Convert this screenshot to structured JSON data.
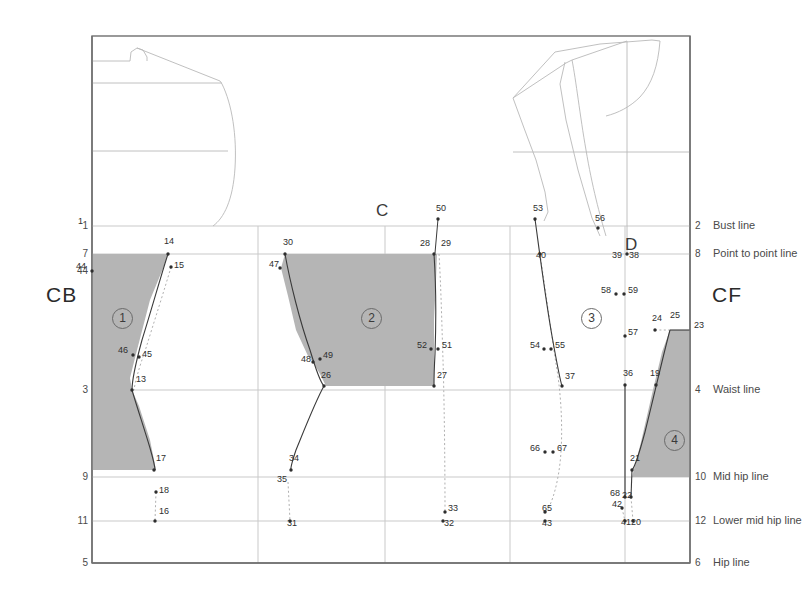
{
  "axis_labels": {
    "center_back": "CB",
    "center_front": "CF",
    "upper_center": "C",
    "bust_point_marker": "D"
  },
  "colors": {
    "piece_fill": "#b5b5b5",
    "piece_stroke": "#3a3a3a",
    "grid": "#c9c9c9",
    "frame": "#6f6f6f",
    "outline": "#b9b9b9",
    "dotted": "#b0b0b0",
    "text": "#3c3c3c"
  },
  "horizontal_lines": [
    {
      "left_num": "1",
      "right_num": "2",
      "right_label": "Bust line",
      "y": 226,
      "x1": 92,
      "x2": 690,
      "weight": "thin"
    },
    {
      "left_num": "7",
      "right_num": "8",
      "right_label": "Point to point line",
      "y": 254,
      "x1": 92,
      "x2": 690,
      "weight": "thin"
    },
    {
      "left_num": "44",
      "right_num": "",
      "right_label": "",
      "y": 271,
      "x1": 92,
      "x2": 150,
      "weight": "none"
    },
    {
      "left_num": "3",
      "right_num": "4",
      "right_label": "Waist line",
      "y": 390,
      "x1": 92,
      "x2": 690,
      "weight": "thin"
    },
    {
      "left_num": "9",
      "right_num": "10",
      "right_label": "Mid hip line",
      "y": 477,
      "x1": 92,
      "x2": 690,
      "weight": "thin"
    },
    {
      "left_num": "11",
      "right_num": "12",
      "right_label": "Lower mid hip line",
      "y": 521,
      "x1": 92,
      "x2": 690,
      "weight": "thin"
    },
    {
      "left_num": "5",
      "right_num": "6",
      "right_label": "Hip line",
      "y": 563,
      "x1": 92,
      "x2": 690,
      "weight": "thick"
    }
  ],
  "vertical_lines": [
    {
      "x": 92,
      "y1": 36,
      "y2": 563,
      "weight": "thick"
    },
    {
      "x": 690,
      "y1": 36,
      "y2": 563,
      "weight": "thick"
    },
    {
      "x": 258,
      "y1": 226,
      "y2": 563,
      "weight": "thin"
    },
    {
      "x": 385,
      "y1": 226,
      "y2": 563,
      "weight": "thin"
    },
    {
      "x": 510,
      "y1": 226,
      "y2": 563,
      "weight": "thin"
    },
    {
      "x": 625,
      "y1": 226,
      "y2": 563,
      "weight": "thin"
    }
  ],
  "frame": {
    "x": 92,
    "y": 36,
    "width": 598,
    "height": 527
  },
  "pieces": [
    {
      "id": "1",
      "label": "1",
      "label_x": 112,
      "label_y": 308,
      "path": "M 92,254 L 168,254 L 164,266 L 150,300 L 136,354 L 130,378 L 132,390 L 139,406 L 150,440 L 156,470 L 92,470 Z"
    },
    {
      "id": "2",
      "label": "2",
      "label_x": 361,
      "label_y": 308,
      "path": "M 285,254 L 437,254 L 436,280 L 434,320 L 434,352 L 434,386 L 326,386 L 320,374 L 313,362 L 308,356 L 296,330 L 288,296 L 281,268 Z"
    },
    {
      "id": "3",
      "label": "3",
      "label_x": 581,
      "label_y": 308,
      "path": ""
    },
    {
      "id": "4",
      "label": "4",
      "label_x": 664,
      "label_y": 430,
      "path": "M 670,330 L 690,330 L 690,477 L 632,477 L 641,442 L 652,394 L 662,352 Z"
    }
  ],
  "points": [
    {
      "n": "1",
      "x": 92,
      "y": 226,
      "dot": false,
      "lx": -14,
      "ly": -5
    },
    {
      "n": "13",
      "x": 132,
      "y": 390,
      "dot": true,
      "lx": 4,
      "ly": -11
    },
    {
      "n": "14",
      "x": 168,
      "y": 254,
      "dot": true,
      "lx": -4,
      "ly": -13
    },
    {
      "n": "15",
      "x": 171,
      "y": 267,
      "dot": true,
      "lx": 3,
      "ly": -2
    },
    {
      "n": "16",
      "x": 155,
      "y": 521,
      "dot": true,
      "lx": 4,
      "ly": -10
    },
    {
      "n": "17",
      "x": 154,
      "y": 470,
      "dot": true,
      "lx": 2,
      "ly": -12
    },
    {
      "n": "18",
      "x": 156,
      "y": 492,
      "dot": true,
      "lx": 3,
      "ly": -2
    },
    {
      "n": "19",
      "x": 656,
      "y": 385,
      "dot": true,
      "lx": -6,
      "ly": -12
    },
    {
      "n": "20",
      "x": 633,
      "y": 521,
      "dot": true,
      "lx": -2,
      "ly": 1
    },
    {
      "n": "21",
      "x": 632,
      "y": 470,
      "dot": true,
      "lx": -2,
      "ly": -12
    },
    {
      "n": "22",
      "x": 631,
      "y": 497,
      "dot": true,
      "lx": -9,
      "ly": -2
    },
    {
      "n": "23",
      "x": 690,
      "y": 330,
      "dot": false,
      "lx": 4,
      "ly": -5
    },
    {
      "n": "24",
      "x": 655,
      "y": 330,
      "dot": true,
      "lx": -3,
      "ly": -12
    },
    {
      "n": "25",
      "x": 670,
      "y": 328,
      "dot": false,
      "lx": 0,
      "ly": -13
    },
    {
      "n": "26",
      "x": 324,
      "y": 386,
      "dot": true,
      "lx": -3,
      "ly": -11
    },
    {
      "n": "27",
      "x": 434,
      "y": 386,
      "dot": true,
      "lx": 3,
      "ly": -11
    },
    {
      "n": "28",
      "x": 434,
      "y": 254,
      "dot": true,
      "lx": -14,
      "ly": -11
    },
    {
      "n": "29",
      "x": 439,
      "y": 254,
      "dot": false,
      "lx": 2,
      "ly": -11
    },
    {
      "n": "30",
      "x": 285,
      "y": 254,
      "dot": true,
      "lx": -2,
      "ly": -12
    },
    {
      "n": "31",
      "x": 290,
      "y": 521,
      "dot": true,
      "lx": -3,
      "ly": 2
    },
    {
      "n": "32",
      "x": 443,
      "y": 521,
      "dot": true,
      "lx": 1,
      "ly": 2
    },
    {
      "n": "33",
      "x": 445,
      "y": 512,
      "dot": true,
      "lx": 3,
      "ly": -4
    },
    {
      "n": "34",
      "x": 291,
      "y": 470,
      "dot": true,
      "lx": -2,
      "ly": -12
    },
    {
      "n": "35",
      "x": 288,
      "y": 482,
      "dot": false,
      "lx": -11,
      "ly": -3
    },
    {
      "n": "36",
      "x": 625,
      "y": 385,
      "dot": true,
      "lx": -2,
      "ly": -12
    },
    {
      "n": "37",
      "x": 562,
      "y": 386,
      "dot": true,
      "lx": 3,
      "ly": -10
    },
    {
      "n": "38",
      "x": 627,
      "y": 254,
      "dot": true,
      "lx": 2,
      "ly": 1
    },
    {
      "n": "39",
      "x": 621,
      "y": 256,
      "dot": false,
      "lx": -9,
      "ly": -1
    },
    {
      "n": "40",
      "x": 540,
      "y": 254,
      "dot": true,
      "lx": -4,
      "ly": 1
    },
    {
      "n": "41",
      "x": 625,
      "y": 521,
      "dot": true,
      "lx": -4,
      "ly": 1
    },
    {
      "n": "42",
      "x": 622,
      "y": 508,
      "dot": true,
      "lx": -10,
      "ly": -4
    },
    {
      "n": "43",
      "x": 545,
      "y": 521,
      "dot": true,
      "lx": -3,
      "ly": 2
    },
    {
      "n": "44",
      "x": 92,
      "y": 271,
      "dot": true,
      "lx": -16,
      "ly": -5
    },
    {
      "n": "45",
      "x": 139,
      "y": 357,
      "dot": true,
      "lx": 3,
      "ly": -3
    },
    {
      "n": "46",
      "x": 133,
      "y": 355,
      "dot": true,
      "lx": -15,
      "ly": -5
    },
    {
      "n": "47",
      "x": 280,
      "y": 268,
      "dot": true,
      "lx": -11,
      "ly": -4
    },
    {
      "n": "48",
      "x": 313,
      "y": 362,
      "dot": true,
      "lx": -12,
      "ly": -3
    },
    {
      "n": "49",
      "x": 320,
      "y": 359,
      "dot": true,
      "lx": 3,
      "ly": -4
    },
    {
      "n": "50",
      "x": 438,
      "y": 219,
      "dot": true,
      "lx": -2,
      "ly": -11
    },
    {
      "n": "51",
      "x": 438,
      "y": 349,
      "dot": true,
      "lx": 4,
      "ly": -4
    },
    {
      "n": "52",
      "x": 431,
      "y": 349,
      "dot": true,
      "lx": -14,
      "ly": -4
    },
    {
      "n": "53",
      "x": 535,
      "y": 219,
      "dot": true,
      "lx": -2,
      "ly": -11
    },
    {
      "n": "54",
      "x": 544,
      "y": 349,
      "dot": true,
      "lx": -14,
      "ly": -4
    },
    {
      "n": "55",
      "x": 551,
      "y": 349,
      "dot": true,
      "lx": 4,
      "ly": -4
    },
    {
      "n": "56",
      "x": 598,
      "y": 228,
      "dot": true,
      "lx": -3,
      "ly": -10
    },
    {
      "n": "57",
      "x": 625,
      "y": 336,
      "dot": true,
      "lx": 3,
      "ly": -4
    },
    {
      "n": "58",
      "x": 616,
      "y": 294,
      "dot": true,
      "lx": -15,
      "ly": -4
    },
    {
      "n": "59",
      "x": 624,
      "y": 294,
      "dot": true,
      "lx": 4,
      "ly": -4
    },
    {
      "n": "65",
      "x": 545,
      "y": 512,
      "dot": true,
      "lx": -3,
      "ly": -4
    },
    {
      "n": "66",
      "x": 545,
      "y": 452,
      "dot": true,
      "lx": -15,
      "ly": -4
    },
    {
      "n": "67",
      "x": 553,
      "y": 452,
      "dot": true,
      "lx": 4,
      "ly": -4
    },
    {
      "n": "68",
      "x": 625,
      "y": 497,
      "dot": true,
      "lx": -15,
      "ly": -4
    }
  ],
  "outline_paths": [
    "M 92,61 L 130,61 L 131,52 L 137,48 L 143,50 L 147,57 L 147,61",
    "M 137,48 L 220,81 L 222,84",
    "M 92,83 L 222,83",
    "M 222,84 C 232,104 237,136 235,168 C 233,200 224,218 213,226",
    "M 92,151 L 228,151",
    "M 513,98 L 555,52 L 600,44 L 652,40 L 660,41",
    "M 513,98 L 524,128 L 536,160 L 545,192 L 548,212 L 544,221",
    "M 660,41 C 658,66 652,84 640,97 C 630,107 618,113 606,116",
    "M 513,98 L 566,63 L 572,60",
    "M 572,60 C 576,80 580,116 586,150 C 592,186 600,216 606,236",
    "M 565,62 L 560,84 L 566,120 L 578,170 L 592,218 L 600,236",
    "M 572,60 L 627,41",
    "M 627,41 L 627,254",
    "M 513,152 L 690,152"
  ],
  "piece_edges": [
    "M 168,254 C 162,272 152,308 142,340 C 136,362 132,378 132,390",
    "M 132,390 C 136,404 144,428 150,448 C 154,462 155,468 155,470",
    "M 285,254 C 290,282 300,322 310,350 C 316,370 320,382 324,386",
    "M 324,386 C 316,400 305,428 296,450 C 292,462 290,468 291,470",
    "M 434,254 C 436,284 436,326 435,354 C 434,372 434,382 434,386",
    "M 535,219 C 539,248 545,296 552,336 C 557,364 560,380 562,386",
    "M 670,330 C 664,352 654,396 645,432 C 638,458 634,468 632,470",
    "M 670,330 L 690,330",
    "M 625,385 L 625,497",
    "M 632,470 L 631,497"
  ],
  "dotted_paths": [
    "M 171,267 C 165,288 154,322 146,348 C 139,368 135,382 134,390",
    "M 156,492 L 155,521",
    "M 288,482 L 290,521",
    "M 439,254 C 441,286 442,330 443,360 C 444,392 445,452 445,512",
    "M 540,254 C 545,288 551,330 556,364 C 560,386 563,420 561,452 C 559,482 552,504 546,512",
    "M 655,330 L 670,330",
    "M 631,497 L 633,521",
    "M 622,508 L 625,521"
  ],
  "connector_paths": [
    "M 438,219 L 435,253",
    "M 535,219 L 535,221"
  ],
  "labels": {
    "cb": "CB",
    "cf": "CF",
    "c": "C",
    "d": "D"
  }
}
